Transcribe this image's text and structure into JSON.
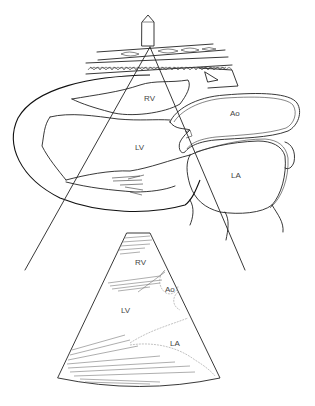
{
  "figure": {
    "anatomy_labels": {
      "rv": "RV",
      "ao": "Ao",
      "lv": "LV",
      "la": "LA"
    },
    "echo_labels": {
      "rv": "RV",
      "ao": "Ao",
      "lv": "LV",
      "la": "LA"
    },
    "parts": [
      "transducer",
      "chest-wall",
      "ultrasound-beam",
      "heart-drawing",
      "echo-sector-image"
    ]
  }
}
